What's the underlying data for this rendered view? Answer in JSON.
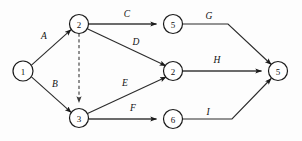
{
  "diagram": {
    "type": "activity-on-arrow-network",
    "nodes": [
      {
        "id": "n1",
        "label": "1",
        "cx": 23,
        "cy": 71,
        "r": 10
      },
      {
        "id": "n2t",
        "label": "2",
        "cx": 79,
        "cy": 24,
        "r": 9.5
      },
      {
        "id": "n3",
        "label": "3",
        "cx": 79,
        "cy": 118,
        "r": 9.5
      },
      {
        "id": "n5t",
        "label": "5",
        "cx": 173,
        "cy": 24,
        "r": 9.5
      },
      {
        "id": "n2m",
        "label": "2",
        "cx": 173,
        "cy": 71,
        "r": 9.5
      },
      {
        "id": "n6",
        "label": "6",
        "cx": 173,
        "cy": 119,
        "r": 9.5
      },
      {
        "id": "n5r",
        "label": "5",
        "cx": 278,
        "cy": 71,
        "r": 9.5
      }
    ],
    "edges": [
      {
        "id": "eA",
        "label": "A",
        "from": "n1",
        "to": "n2t",
        "style": "solid",
        "label_x": 44,
        "label_y": 36
      },
      {
        "id": "eB",
        "label": "B",
        "from": "n1",
        "to": "n3",
        "style": "solid",
        "label_x": 55,
        "label_y": 84
      },
      {
        "id": "eC",
        "label": "C",
        "from": "n2t",
        "to": "n5t",
        "style": "solid",
        "label_x": 127,
        "label_y": 14
      },
      {
        "id": "eD",
        "label": "D",
        "from": "n2t",
        "to": "n2m",
        "style": "solid",
        "label_x": 136,
        "label_y": 42
      },
      {
        "id": "eE",
        "label": "E",
        "from": "n3",
        "to": "n2m",
        "style": "solid",
        "label_x": 125,
        "label_y": 83
      },
      {
        "id": "eF",
        "label": "F",
        "from": "n3",
        "to": "n6",
        "style": "solid",
        "label_x": 133,
        "label_y": 108
      },
      {
        "id": "eG",
        "label": "G",
        "from": "n5t",
        "to": "n5r",
        "style": "solid",
        "label_x": 209,
        "label_y": 16
      },
      {
        "id": "eH",
        "label": "H",
        "from": "n2m",
        "to": "n5r",
        "style": "solid",
        "label_x": 217,
        "label_y": 60
      },
      {
        "id": "eI",
        "label": "I",
        "from": "n6",
        "to": "n5r",
        "style": "solid",
        "label_x": 208,
        "label_y": 112
      },
      {
        "id": "eDummy",
        "label": "",
        "from": "n2t",
        "to": "n3",
        "style": "dashed",
        "label_x": 0,
        "label_y": 0
      }
    ],
    "colors": {
      "stroke": "#2b2b2b",
      "node_fill": "#ffffff",
      "text": "#111111",
      "background": "#fdfdfd"
    }
  }
}
